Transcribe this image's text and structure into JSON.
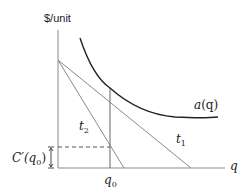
{
  "diagram": {
    "y_axis_label": "$/unit",
    "x_axis_label": "q",
    "curve_label_main": "a",
    "curve_label_arg": "(q)",
    "tangent1_label": "t",
    "tangent1_sub": "1",
    "tangent2_label": "t",
    "tangent2_sub": "2",
    "q0_label": "q",
    "q0_sub": "0",
    "marginal_cost_label_pre": "C′(q",
    "marginal_cost_label_sub": "0",
    "marginal_cost_label_post": ")",
    "colors": {
      "axis": "#888888",
      "curve": "#222222",
      "tangent": "#888888",
      "dashed": "#555555",
      "text": "#222222"
    }
  }
}
